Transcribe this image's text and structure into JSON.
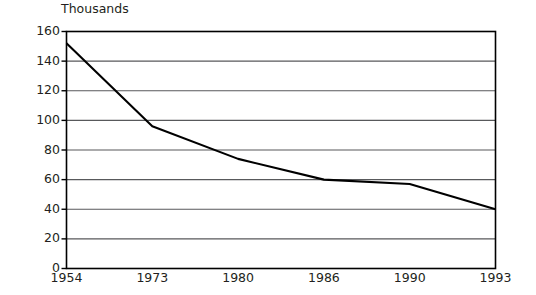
{
  "chart_data": {
    "type": "line",
    "title": "",
    "subtitle": "",
    "unit_label": "Thousands",
    "xlabel": "",
    "ylabel": "",
    "categories": [
      "1954",
      "1973",
      "1980",
      "1986",
      "1990",
      "1993"
    ],
    "values": [
      152,
      96,
      74,
      60,
      57,
      40
    ],
    "series": [
      {
        "name": "",
        "values": [
          152,
          96,
          74,
          60,
          57,
          40
        ]
      }
    ],
    "ylim": [
      0,
      160
    ],
    "y_ticks": [
      0,
      20,
      40,
      60,
      80,
      100,
      120,
      140,
      160
    ],
    "y_tick_labels": [
      "0",
      "20",
      "40",
      "60",
      "80",
      "100",
      "120",
      "140",
      "160"
    ],
    "grid": true,
    "grid_axis": "y",
    "legend": false,
    "legend_position": "none",
    "line_color": "#000000",
    "axis_color": "#000000",
    "grid_color": "#58595b",
    "background_color": "#ffffff",
    "annotations": []
  }
}
